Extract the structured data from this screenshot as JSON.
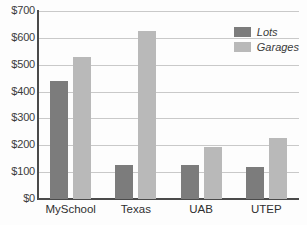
{
  "chart_data": {
    "type": "bar",
    "title": "",
    "xlabel": "",
    "ylabel": "",
    "categories": [
      "MySchool",
      "Texas",
      "UAB",
      "UTEP"
    ],
    "series": [
      {
        "name": "Lots",
        "color": "#7c7c7c",
        "values": [
          440,
          127,
          128,
          120
        ]
      },
      {
        "name": "Garages",
        "color": "#b9b9b9",
        "values": [
          530,
          625,
          195,
          228
        ]
      }
    ],
    "ylim": [
      0,
      700
    ],
    "ytick_step": 100,
    "ytick_labels": [
      "$0",
      "$100",
      "$200",
      "$300",
      "$400",
      "$500",
      "$600",
      "$700"
    ],
    "ytick_values": [
      0,
      100,
      200,
      300,
      400,
      500,
      600,
      700
    ],
    "grid": true,
    "legend_position": "top-right",
    "currency_prefix": "$"
  }
}
